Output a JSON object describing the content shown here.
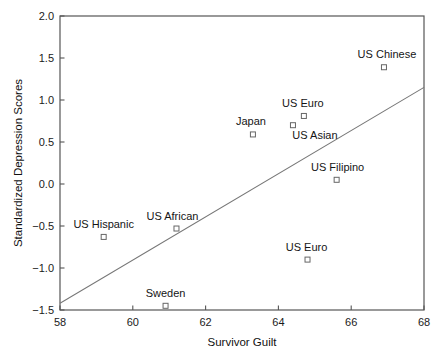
{
  "chart_data": {
    "type": "scatter",
    "title": "",
    "xlabel": "Survivor Guilt",
    "ylabel": "Standardized Depression Scores",
    "xlim": [
      58,
      68
    ],
    "ylim": [
      -1.5,
      2.0
    ],
    "xticks": [
      "58",
      "60",
      "62",
      "64",
      "66",
      "68"
    ],
    "xtick_values": [
      58,
      60,
      62,
      64,
      66,
      68
    ],
    "yticks": [
      "2.0",
      "1.5",
      "1.0",
      "0.5",
      "0.0",
      "−0.5",
      "−1.0",
      "−1.5"
    ],
    "ytick_values": [
      2.0,
      1.5,
      1.0,
      0.5,
      0.0,
      -0.5,
      -1.0,
      -1.5
    ],
    "grid": false,
    "legend": "none",
    "marker": "open-square",
    "points": [
      {
        "label": "US Hispanic",
        "x": 59.2,
        "y": -0.63,
        "label_dx": 0,
        "label_dy": -13
      },
      {
        "label": "Sweden",
        "x": 60.9,
        "y": -1.45,
        "label_dx": 0,
        "label_dy": -13
      },
      {
        "label": "US African",
        "x": 61.2,
        "y": -0.53,
        "label_dx": -4,
        "label_dy": -13
      },
      {
        "label": "Japan",
        "x": 63.3,
        "y": 0.59,
        "label_dx": -2,
        "label_dy": -13
      },
      {
        "label": "US Asian",
        "x": 64.4,
        "y": 0.7,
        "label_dx": 22,
        "label_dy": 10
      },
      {
        "label": "US Euro",
        "x": 64.7,
        "y": 0.81,
        "label_dx": -1,
        "label_dy": -13
      },
      {
        "label": "US Euro",
        "x": 64.8,
        "y": -0.9,
        "label_dx": -1,
        "label_dy": -13
      },
      {
        "label": "US Filipino",
        "x": 65.6,
        "y": 0.05,
        "label_dx": 1,
        "label_dy": -13
      },
      {
        "label": "US Chinese",
        "x": 66.9,
        "y": 1.39,
        "label_dx": 3,
        "label_dy": -13
      }
    ],
    "trendline": {
      "name": "regression-line",
      "x_start": 58.0,
      "y_start": -1.42,
      "x_end": 68.0,
      "y_end": 1.15
    },
    "colors": {
      "axis": "#555555",
      "marker": "#666666",
      "line": "#777777",
      "text": "#151515",
      "background": "#ffffff"
    }
  }
}
